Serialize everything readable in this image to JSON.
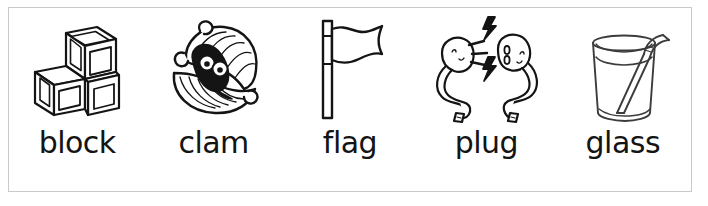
{
  "worksheet": {
    "title": "Consonant blend picture word cards",
    "frame_color": "#c9c9c9",
    "background_color": "#ffffff",
    "ink_color": "#141414",
    "columns": 5,
    "items": [
      {
        "label": "block",
        "icon": "blocks-icon",
        "icon_description": "three stacked toy cubes, two on the bottom and one on top"
      },
      {
        "label": "clam",
        "icon": "clam-icon",
        "icon_description": "open clam shell with a dark creature with two eyes inside"
      },
      {
        "label": "flag",
        "icon": "flag-icon",
        "icon_description": "flag on a vertical pole with a wavy pennant"
      },
      {
        "label": "plug",
        "icon": "plug-icon",
        "icon_description": "electric plug and socket with curly cords and lightning bolts between them"
      },
      {
        "label": "glass",
        "icon": "glass-icon",
        "icon_description": "drinking glass of liquid with a bent straw"
      }
    ]
  }
}
